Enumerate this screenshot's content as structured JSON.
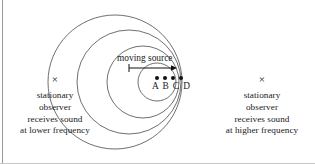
{
  "figure": {
    "background_color": "#ffffff",
    "stroke_color": "#555555",
    "text_color": "#1a1a1a",
    "width": 315,
    "height": 164
  },
  "source": {
    "label": "moving source",
    "direction_arrow": "right-arrow-icon",
    "position_dots": [
      "dot",
      "dot",
      "dot",
      "dot"
    ],
    "position_labels": "A B C D"
  },
  "observers": {
    "left": {
      "marker": "×",
      "line1": "stationary",
      "line2": "observer",
      "line3": "receives sound",
      "line4": "at lower frequency"
    },
    "right": {
      "marker": "×",
      "line1": "stationary",
      "line2": "observer",
      "line3": "receives sound",
      "line4": "at higher frequency"
    }
  },
  "chart_data": {
    "type": "diagram",
    "wavefronts": [
      {
        "name": "A",
        "cx": 115,
        "cy": 82,
        "r": 67
      },
      {
        "name": "B",
        "cx": 129,
        "cy": 82,
        "r": 52
      },
      {
        "name": "C",
        "cx": 143,
        "cy": 82,
        "r": 36
      },
      {
        "name": "D",
        "cx": 157,
        "cy": 82,
        "r": 19
      }
    ],
    "source_path": {
      "x1": 129,
      "y1": 68,
      "x2": 177,
      "y2": 68
    },
    "observer_marks": [
      {
        "side": "left",
        "x": 54,
        "y": 80
      },
      {
        "side": "right",
        "x": 262,
        "y": 80
      }
    ]
  }
}
